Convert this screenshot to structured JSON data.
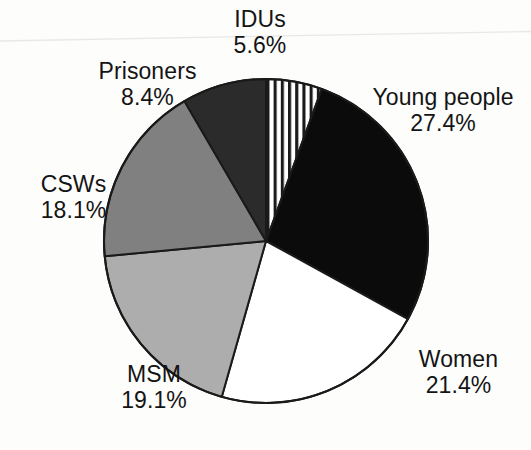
{
  "figure": {
    "background_color": "#fdfdfc",
    "outline_color": "#1a1a1a",
    "center_x": 266,
    "center_y": 241,
    "radius": 162,
    "start_angle_deg": 0
  },
  "chart_data": {
    "type": "pie",
    "title": "",
    "subtitle": "",
    "xlabel": "",
    "ylabel": "",
    "legend_position": "outside-labels",
    "grid": false,
    "units": "percent",
    "total": 100.0,
    "start_angle_deg": 0,
    "direction": "clockwise",
    "categories": [
      "IDUs",
      "Young people",
      "Women",
      "MSM",
      "CSWs",
      "Prisoners"
    ],
    "values": [
      5.6,
      27.4,
      21.4,
      19.1,
      18.1,
      8.4
    ],
    "slices": [
      {
        "label": "IDUs",
        "value": 5.6,
        "value_text": "5.6%",
        "fill": "vertical-stripes",
        "fill_color": "#ffffff",
        "stripe_color": "#1a1a1a",
        "start_deg": 0.0,
        "end_deg": 20.16
      },
      {
        "label": "Young people",
        "value": 27.4,
        "value_text": "27.4%",
        "fill": "solid",
        "fill_color": "#0b0b0b",
        "start_deg": 20.16,
        "end_deg": 118.8
      },
      {
        "label": "Women",
        "value": 21.4,
        "value_text": "21.4%",
        "fill": "solid",
        "fill_color": "#ffffff",
        "start_deg": 118.8,
        "end_deg": 195.84
      },
      {
        "label": "MSM",
        "value": 19.1,
        "value_text": "19.1%",
        "fill": "solid",
        "fill_color": "#adadad",
        "start_deg": 195.84,
        "end_deg": 264.6
      },
      {
        "label": "CSWs",
        "value": 18.1,
        "value_text": "18.1%",
        "fill": "solid",
        "fill_color": "#808080",
        "start_deg": 264.6,
        "end_deg": 329.76
      },
      {
        "label": "Prisoners",
        "value": 8.4,
        "value_text": "8.4%",
        "fill": "solid",
        "fill_color": "#2b2b2b",
        "start_deg": 329.76,
        "end_deg": 360.0
      }
    ]
  },
  "labels": {
    "idus": {
      "name": "IDUs",
      "value": "5.6%"
    },
    "prisoners": {
      "name": "Prisoners",
      "value": "8.4%"
    },
    "csws": {
      "name": "CSWs",
      "value": "18.1%"
    },
    "msm": {
      "name": "MSM",
      "value": "19.1%"
    },
    "women": {
      "name": "Women",
      "value": "21.4%"
    },
    "young_people": {
      "name": "Young people",
      "value": "27.4%"
    }
  }
}
